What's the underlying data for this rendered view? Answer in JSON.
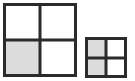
{
  "figure": {
    "background_color": "#ffffff",
    "border_color": "#2b2b2b",
    "shade_color": "#dcdcdc",
    "unshaded_color": "#ffffff"
  },
  "shapes": [
    {
      "id": "large-square",
      "name": "Large square divided into four equal parts",
      "rows": 2,
      "columns": 2,
      "total_parts": 4,
      "shaded_parts": 1,
      "fraction": "1/4",
      "cells": [
        {
          "position": "top-left",
          "shaded": false
        },
        {
          "position": "top-right",
          "shaded": false
        },
        {
          "position": "bottom-left",
          "shaded": true
        },
        {
          "position": "bottom-right",
          "shaded": false
        }
      ]
    },
    {
      "id": "small-square",
      "name": "Small square divided into four equal parts",
      "rows": 2,
      "columns": 2,
      "total_parts": 4,
      "shaded_parts": 2,
      "fraction": "2/4",
      "cells": [
        {
          "position": "top-left",
          "shaded": true
        },
        {
          "position": "top-right",
          "shaded": false
        },
        {
          "position": "bottom-left",
          "shaded": true
        },
        {
          "position": "bottom-right",
          "shaded": false
        }
      ]
    }
  ],
  "chart_data": {
    "type": "table",
    "title": "",
    "xlabel": "",
    "ylabel": "",
    "categories": [
      "large-square",
      "small-square"
    ],
    "series": [
      {
        "name": "shaded_parts",
        "values": [
          1,
          2
        ]
      },
      {
        "name": "total_parts",
        "values": [
          4,
          4
        ]
      }
    ],
    "annotations": []
  }
}
